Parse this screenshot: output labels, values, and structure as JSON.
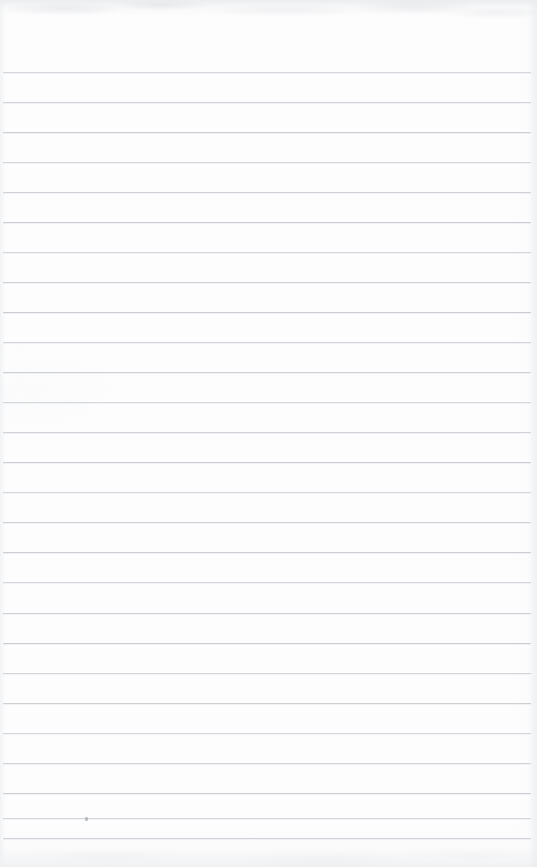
{
  "document": {
    "kind": "scanned-ruled-notebook-page",
    "title": "Blank Lined Page",
    "content_text": "",
    "has_handwriting": false,
    "page_width": 537,
    "page_height": 867
  },
  "paper": {
    "background_color": "#fdfdfd",
    "edge_shadow_color": "#e9eaec",
    "top_band_color": "#e9eaec",
    "bottom_band_color": "#eceded"
  },
  "ruling": {
    "line_color": "#c9cdd2",
    "line_thickness_px": 1,
    "line_spacing_px": 30,
    "first_line_y": 72,
    "line_start_x": 3,
    "line_end_x": 531,
    "line_count": 26,
    "line_y_positions": [
      72,
      102,
      132,
      162,
      192,
      222,
      252,
      282,
      312,
      342,
      372,
      402,
      432,
      462,
      492,
      522,
      552,
      582,
      613,
      643,
      673,
      703,
      733,
      763,
      793,
      818,
      838
    ]
  },
  "marks": [
    {
      "name": "pencil-smudge",
      "x": 85,
      "y": 817,
      "width": 3,
      "height": 4,
      "color": "#a9adb3"
    }
  ]
}
